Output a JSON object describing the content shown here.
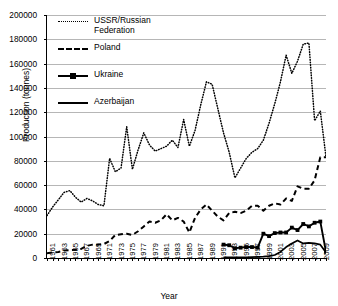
{
  "chart_data": {
    "type": "line",
    "title": "",
    "xlabel": "Year",
    "ylabel": "Production (tonnes)",
    "ylim": [
      0,
      200000
    ],
    "xlim": [
      1961,
      2010
    ],
    "ytick_labels": [
      "200000",
      "180000",
      "160000",
      "140000",
      "120000",
      "100000",
      "80000",
      "60000",
      "40000",
      "20000",
      "0"
    ],
    "ytick_values": [
      200000,
      180000,
      160000,
      140000,
      120000,
      100000,
      80000,
      60000,
      40000,
      20000,
      0
    ],
    "xtick_labels": [
      "1961",
      "1963",
      "1965",
      "1967",
      "1969",
      "1971",
      "1973",
      "1975",
      "1977",
      "1979",
      "1981",
      "1983",
      "1985",
      "1987",
      "1989",
      "1991",
      "1993",
      "1995",
      "1997",
      "1999",
      "2001",
      "2003",
      "2005",
      "2007",
      "2009"
    ],
    "grid": true,
    "legend_position": "top-left-inside",
    "x": [
      1961,
      1962,
      1963,
      1964,
      1965,
      1966,
      1967,
      1968,
      1969,
      1970,
      1971,
      1972,
      1973,
      1974,
      1975,
      1976,
      1977,
      1978,
      1979,
      1980,
      1981,
      1982,
      1983,
      1984,
      1985,
      1986,
      1987,
      1988,
      1989,
      1990,
      1991,
      1992,
      1993,
      1994,
      1995,
      1996,
      1997,
      1998,
      1999,
      2000,
      2001,
      2002,
      2003,
      2004,
      2005,
      2006,
      2007,
      2008,
      2009,
      2010
    ],
    "series": [
      {
        "name": "USSR/Russian Federation",
        "style": "dotted",
        "values": [
          35000,
          42000,
          48000,
          54000,
          55500,
          50000,
          46000,
          49000,
          47000,
          44000,
          43000,
          82000,
          71000,
          74000,
          108000,
          73000,
          89000,
          103000,
          93000,
          88000,
          90000,
          92000,
          97000,
          91000,
          114000,
          92000,
          105000,
          126000,
          145000,
          143000,
          123000,
          103000,
          87000,
          66000,
          74000,
          82000,
          87000,
          90000,
          97000,
          111000,
          127000,
          145000,
          167000,
          152000,
          162000,
          176000,
          177000,
          113000,
          121000,
          83000
        ]
      },
      {
        "name": "Poland",
        "style": "dashed",
        "values": [
          4000,
          4500,
          5000,
          6200,
          6500,
          6800,
          7500,
          10000,
          11000,
          11000,
          11500,
          14000,
          19000,
          19500,
          20000,
          19000,
          22000,
          26000,
          30000,
          29000,
          31000,
          36000,
          31000,
          33000,
          30000,
          21000,
          33000,
          40000,
          44000,
          39000,
          34000,
          31000,
          37000,
          38000,
          37000,
          39000,
          43000,
          43000,
          39000,
          43000,
          45000,
          44000,
          49000,
          47000,
          59000,
          57000,
          57000,
          64000,
          83000,
          83000
        ]
      },
      {
        "name": "Ukraine",
        "style": "solid-marker",
        "values": [
          null,
          null,
          null,
          null,
          null,
          null,
          null,
          null,
          null,
          null,
          null,
          null,
          null,
          null,
          null,
          null,
          null,
          null,
          null,
          null,
          null,
          null,
          null,
          null,
          null,
          null,
          null,
          null,
          null,
          null,
          null,
          11000,
          10500,
          8000,
          8500,
          9000,
          9000,
          8500,
          20000,
          18000,
          20500,
          21000,
          21000,
          25000,
          23000,
          28000,
          26000,
          29000,
          30000,
          5000
        ]
      },
      {
        "name": "Azerbaijan",
        "style": "solid",
        "values": [
          null,
          null,
          null,
          null,
          null,
          null,
          null,
          null,
          null,
          null,
          null,
          null,
          null,
          null,
          null,
          null,
          null,
          null,
          null,
          null,
          null,
          null,
          null,
          null,
          null,
          null,
          null,
          null,
          null,
          null,
          null,
          500,
          500,
          500,
          500,
          600,
          700,
          900,
          1100,
          1500,
          2500,
          5000,
          9000,
          12000,
          14500,
          12000,
          12500,
          12000,
          11000,
          4500
        ]
      }
    ],
    "legend": [
      {
        "label": "USSR/Russian\nFederation",
        "style": "dotted"
      },
      {
        "label": "Poland",
        "style": "dashed"
      },
      {
        "label": "Ukraine",
        "style": "solid-marker"
      },
      {
        "label": "Azerbaijan",
        "style": "solid"
      }
    ]
  }
}
